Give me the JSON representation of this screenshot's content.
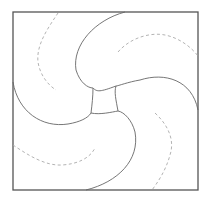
{
  "diagram": {
    "title": "Pinwheel tessellation of a square",
    "colors": {
      "background": "#ffffff",
      "frame": "#555555",
      "solid_curve": "#666666",
      "dashed_curve": "#aaaaaa"
    },
    "frame": {
      "x": 13,
      "y": 12,
      "width": 185,
      "height": 178
    },
    "center_square_corners": [
      [
        93,
        88
      ],
      [
        116,
        86
      ],
      [
        118,
        111
      ],
      [
        91,
        113
      ]
    ],
    "solid_arcs": [
      {
        "id": "top-petal",
        "d": "M125,12 C95,20 72,45 76,70 C80,83 88,88 93,88 C97,92 100,92 116,86"
      },
      {
        "id": "right-petal",
        "d": "M198,110 C192,80 165,72 140,80 C128,82 118,86 116,86 C114,92 116,100 118,111"
      },
      {
        "id": "bottom-petal",
        "d": "M86,190 C118,182 140,160 135,132 C132,120 124,112 118,111 C112,112 100,115 91,113"
      },
      {
        "id": "left-petal",
        "d": "M13,82 C18,112 42,128 68,124 C80,122 88,118 91,113 C92,105 93,96 93,88"
      }
    ],
    "dashed_arcs": [
      {
        "id": "top-left-dash",
        "d": "M58,13 C48,28 36,45 38,62 C40,75 48,85 56,90"
      },
      {
        "id": "top-right-dash",
        "d": "M118,52 C130,38 150,32 165,35 C180,38 192,48 198,56"
      },
      {
        "id": "bottom-right-dash",
        "d": "M155,113 C168,125 175,140 170,155 C166,170 158,182 152,190"
      },
      {
        "id": "bottom-left-dash",
        "d": "M13,145 C28,155 45,166 62,165 C78,164 90,158 95,148"
      }
    ]
  }
}
